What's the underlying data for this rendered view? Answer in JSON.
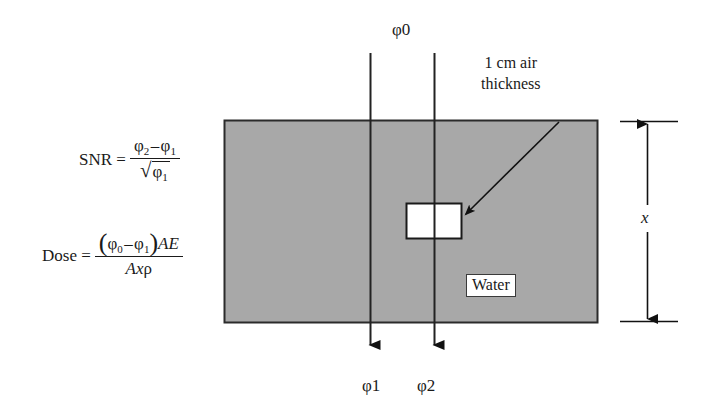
{
  "figure": {
    "type": "physics-schematic"
  },
  "beams": {
    "incident_label": "φ0",
    "exit_left_label": "φ1",
    "exit_right_label": "φ2"
  },
  "phantom": {
    "material_label": "Water",
    "thickness_label": "x",
    "fill_color": "#a8a8a8",
    "border_color": "#2b2b2b"
  },
  "cavity": {
    "annotation_line1": "1 cm air",
    "annotation_line2": "thickness",
    "fill_color": "#ffffff",
    "border_color": "#1a1a1a"
  },
  "equations": {
    "snr": {
      "lhs": "SNR =",
      "numerator_a": "φ",
      "numerator_a_sub": "2",
      "numerator_minus": "–",
      "numerator_b": "φ",
      "numerator_b_sub": "1",
      "radical": "√",
      "denominator_sym": "φ",
      "denominator_sub": "1"
    },
    "dose": {
      "lhs": "Dose =",
      "paren_open": "(",
      "num_a": "φ",
      "num_a_sub": "0",
      "num_minus": "–",
      "num_b": "φ",
      "num_b_sub": "1",
      "paren_close": ")",
      "num_tail": "AE",
      "den_A": "A",
      "den_x": "x",
      "den_rho": "ρ"
    }
  },
  "colors": {
    "stroke": "#1a1a1a",
    "water_gray": "#a8a8a8",
    "background": "#ffffff"
  }
}
